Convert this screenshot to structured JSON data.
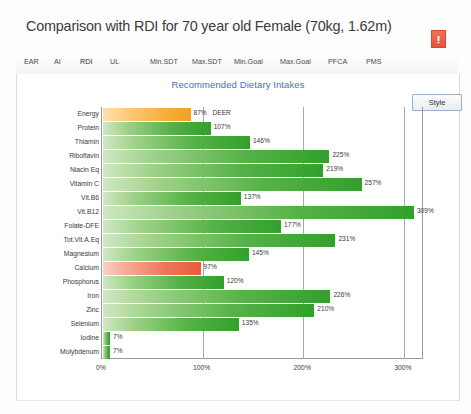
{
  "window": {
    "title": "Comparison with RDI for 70 year old Female (70kg, 1.62m)",
    "close_icon": "close-icon"
  },
  "tabs": [
    {
      "label": "EAR",
      "active": false
    },
    {
      "label": "AI",
      "active": false
    },
    {
      "label": "RDI",
      "active": true
    },
    {
      "label": "UL",
      "active": false
    },
    {
      "label": "Min.SDT",
      "active": false
    },
    {
      "label": "Max.SDT",
      "active": false
    },
    {
      "label": "Min.Goal",
      "active": false
    },
    {
      "label": "Max.Goal",
      "active": false
    },
    {
      "label": "PFCA",
      "active": false
    },
    {
      "label": "PMS",
      "active": false
    }
  ],
  "toolbar": {
    "style_label": "Style"
  },
  "colors": {
    "title_text": "#3b3b3b",
    "chart_title": "#4a6fb5",
    "bar_green": "#32a02c",
    "bar_orange": "#f2a01f",
    "bar_red": "#ea5a3c",
    "close_button": "#e8543c"
  },
  "chart_data": {
    "type": "bar",
    "orientation": "horizontal",
    "title": "Recommended Dietary Intakes",
    "xlabel": "",
    "ylabel": "",
    "xlim": [
      0,
      320
    ],
    "xticks": [
      "0%",
      "100%",
      "200%",
      "300%"
    ],
    "xtick_values": [
      0,
      100,
      200,
      300
    ],
    "grid": true,
    "legend": "none",
    "categories": [
      "Energy",
      "Protein",
      "Thiamin",
      "Riboflavin",
      "Niacin Eq",
      "Vitamin C",
      "Vit.B6",
      "Vit.B12",
      "Folate-DFE",
      "Tot.Vit.A.Eq",
      "Magnesium",
      "Calcium",
      "Phosphorus",
      "Iron",
      "Zinc",
      "Selenium",
      "Iodine",
      "Molybdenum"
    ],
    "values": [
      87,
      107,
      146,
      225,
      219,
      257,
      137,
      309,
      177,
      231,
      145,
      97,
      120,
      226,
      210,
      135,
      7,
      7
    ],
    "value_labels": [
      "87%",
      "107%",
      "146%",
      "225%",
      "219%",
      "257%",
      "137%",
      "309%",
      "177%",
      "231%",
      "145%",
      "97%",
      "120%",
      "226%",
      "210%",
      "135%",
      "7%",
      "7%"
    ],
    "bar_colors": [
      "orange",
      "green",
      "green",
      "green",
      "green",
      "green",
      "green",
      "green",
      "green",
      "green",
      "green",
      "red",
      "green",
      "green",
      "green",
      "green",
      "green",
      "green"
    ],
    "annotations": [
      {
        "category": "Energy",
        "text": "DEER"
      }
    ]
  }
}
